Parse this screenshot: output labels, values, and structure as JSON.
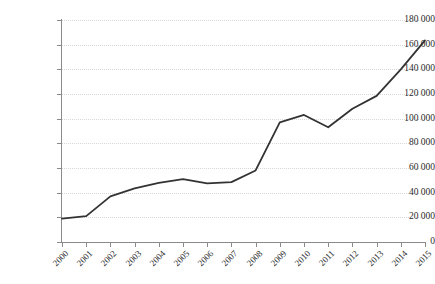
{
  "figure": {
    "title_strip_text": "",
    "background_color": "#ffffff"
  },
  "axis": {
    "y_tick_labels": [
      "180 000",
      "160 000",
      "140 000",
      "120 000",
      "100 000",
      "80 000",
      "60 000",
      "40 000",
      "20 000",
      "0"
    ],
    "x_tick_labels": [
      "2000",
      "2001",
      "2002",
      "2003",
      "2004",
      "2005",
      "2006",
      "2007",
      "2008",
      "2009",
      "2010",
      "2011",
      "2012",
      "2013",
      "2014",
      "2015"
    ],
    "axis_color": "#8a8a8a",
    "grid_color": "#d8d8dc"
  },
  "chart_data": {
    "type": "line",
    "title": "",
    "xlabel": "",
    "ylabel": "",
    "categories": [
      "2000",
      "2001",
      "2002",
      "2003",
      "2004",
      "2005",
      "2006",
      "2007",
      "2008",
      "2009",
      "2010",
      "2011",
      "2012",
      "2013",
      "2014",
      "2015"
    ],
    "x": [
      2000,
      2001,
      2002,
      2003,
      2004,
      2005,
      2006,
      2007,
      2008,
      2009,
      2010,
      2011,
      2012,
      2013,
      2014,
      2015
    ],
    "values": [
      19000,
      21000,
      37000,
      43500,
      48000,
      51000,
      47500,
      48500,
      58000,
      97000,
      103000,
      93000,
      108000,
      118500,
      140000,
      163500
    ],
    "series": [
      {
        "name": "",
        "color": "#333333",
        "line_width": 1.8,
        "markers": false,
        "values": [
          19000,
          21000,
          37000,
          43500,
          48000,
          51000,
          47500,
          48500,
          58000,
          97000,
          103000,
          93000,
          108000,
          118500,
          140000,
          163500
        ]
      }
    ],
    "ylim": [
      0,
      180000
    ],
    "y_tick_step": 20000,
    "y_tick_values": [
      0,
      20000,
      40000,
      60000,
      80000,
      100000,
      120000,
      140000,
      160000,
      180000
    ],
    "xlim": [
      2000,
      2015
    ],
    "grid": "horizontal-dotted",
    "legend": "none",
    "thousands_separator": " "
  }
}
